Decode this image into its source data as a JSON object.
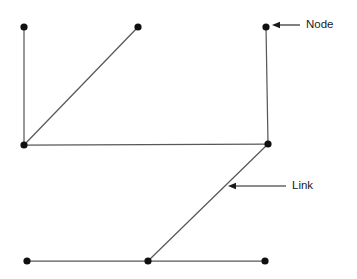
{
  "diagram": {
    "canvas": {
      "width": 357,
      "height": 279,
      "background": "#ffffff"
    },
    "style": {
      "link_color": "#585858",
      "node_color": "#101010",
      "annotation_color": "#1a1a1a",
      "link_stroke_width": 1.25,
      "node_radius": 3.6
    },
    "nodes": [
      {
        "id": "n-top-left",
        "label": "",
        "x": 24,
        "y": 27
      },
      {
        "id": "n-top-middle",
        "label": "",
        "x": 138,
        "y": 27
      },
      {
        "id": "n-top-right",
        "label": "",
        "x": 266,
        "y": 27
      },
      {
        "id": "n-left-junction",
        "label": "",
        "x": 24,
        "y": 145
      },
      {
        "id": "n-right-junction",
        "label": "",
        "x": 268,
        "y": 144
      },
      {
        "id": "n-bottom-left",
        "label": "",
        "x": 27,
        "y": 261
      },
      {
        "id": "n-bottom-middle",
        "label": "",
        "x": 148,
        "y": 261
      },
      {
        "id": "n-bottom-right",
        "label": "",
        "x": 265,
        "y": 261
      }
    ],
    "links": [
      {
        "id": "l-left-vertical",
        "from": "n-top-left",
        "to": "n-left-junction",
        "x1": 24,
        "y1": 27,
        "x2": 24,
        "y2": 145
      },
      {
        "id": "l-left-diagonal",
        "from": "n-left-junction",
        "to": "n-top-middle",
        "x1": 24,
        "y1": 145,
        "x2": 138,
        "y2": 27
      },
      {
        "id": "l-middle-horizontal",
        "from": "n-left-junction",
        "to": "n-right-junction",
        "x1": 24,
        "y1": 145,
        "x2": 268,
        "y2": 144
      },
      {
        "id": "l-right-vertical",
        "from": "n-top-right",
        "to": "n-right-junction",
        "x1": 266,
        "y1": 27,
        "x2": 268,
        "y2": 144
      },
      {
        "id": "l-right-diagonal",
        "from": "n-right-junction",
        "to": "n-bottom-middle",
        "x1": 268,
        "y1": 144,
        "x2": 148,
        "y2": 261
      },
      {
        "id": "l-bottom-left-seg",
        "from": "n-bottom-left",
        "to": "n-bottom-middle",
        "x1": 27,
        "y1": 261,
        "x2": 148,
        "y2": 261
      },
      {
        "id": "l-bottom-right-seg",
        "from": "n-bottom-middle",
        "to": "n-bottom-right",
        "x1": 148,
        "y1": 261,
        "x2": 265,
        "y2": 261
      }
    ],
    "annotations": [
      {
        "id": "a-node",
        "label": "Node",
        "arrow": {
          "tail_x": 300,
          "tail_y": 25,
          "head_x": 272,
          "head_y": 25
        },
        "text_x": 306,
        "text_y": 25,
        "target": "n-top-right"
      },
      {
        "id": "a-link",
        "label": "Link",
        "arrow": {
          "tail_x": 286,
          "tail_y": 186,
          "head_x": 228,
          "head_y": 186
        },
        "text_x": 292,
        "text_y": 186,
        "target": "l-right-diagonal"
      }
    ]
  }
}
